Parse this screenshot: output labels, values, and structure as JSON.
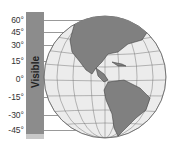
{
  "bar": {
    "label": "Visible"
  },
  "latitudes": [
    {
      "label": "60°",
      "y": 20,
      "len": 60
    },
    {
      "label": "45°",
      "y": 32,
      "len": 40
    },
    {
      "label": "30°",
      "y": 45,
      "len": 32
    },
    {
      "label": "15°",
      "y": 61,
      "len": 30
    },
    {
      "label": "0°",
      "y": 79,
      "len": 30
    },
    {
      "label": "-15°",
      "y": 97,
      "len": 30
    },
    {
      "label": "-30°",
      "y": 115,
      "len": 32
    },
    {
      "label": "-45°",
      "y": 130,
      "len": 45
    }
  ],
  "colors": {
    "land": "#808080",
    "ocean": "#ececec",
    "bar": "#8c8c8c"
  }
}
